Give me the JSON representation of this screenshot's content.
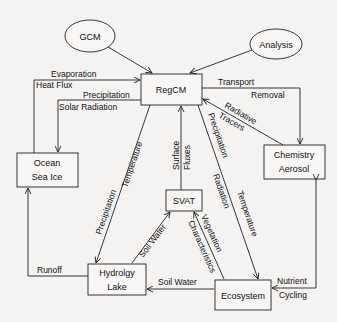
{
  "diagram": {
    "nodes": {
      "gcm": {
        "label": "GCM",
        "shape": "ellipse"
      },
      "analysis": {
        "label": "Analysis",
        "shape": "ellipse"
      },
      "regcm": {
        "label": "RegCM",
        "shape": "box"
      },
      "ocean": {
        "line1": "Ocean",
        "line2": "Sea Ice",
        "shape": "box"
      },
      "chemistry": {
        "line1": "Chemistry",
        "line2": "Aerosol",
        "shape": "box"
      },
      "svat": {
        "label": "SVAT",
        "shape": "box"
      },
      "hydrology": {
        "line1": "Hydrolgy",
        "line2": "Lake",
        "shape": "box"
      },
      "ecosystem": {
        "label": "Ecosystem",
        "shape": "box"
      }
    },
    "edges": {
      "evaporation": "Evaporation",
      "heat_flux": "Heat Flux",
      "precipitation_ocean": "Precipitation",
      "solar_radiation": "Solar Radiation",
      "transport": "Transport",
      "removal": "Removal",
      "radiative": "Radiative",
      "tracers": "Tracers",
      "precipitation_hydro": "Precipitation",
      "temperature_hydro": "Temperature",
      "surface": "Surface",
      "fluxes": "Fluxes",
      "precipitation_eco": "Precipitation",
      "radiation_eco": "Radiation",
      "temperature_eco": "Temperature",
      "soil_water_svat": "Soil Water",
      "vegetation": "Vegetation",
      "characteristics": "Characteristics",
      "runoff": "Runoff",
      "soil_water_eco": "Soil Water",
      "nutrient": "Nutrient",
      "cycling": "Cycling"
    }
  }
}
